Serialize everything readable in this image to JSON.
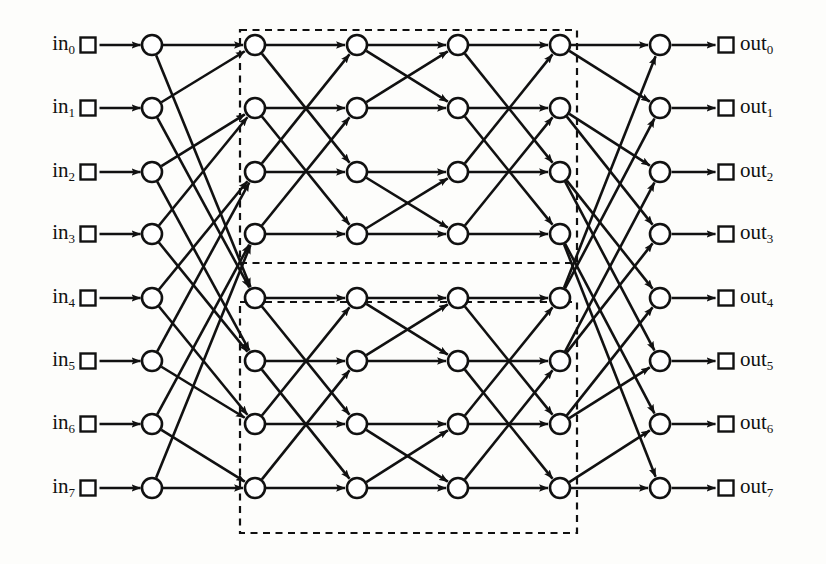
{
  "diagram": {
    "type": "multistage-interconnection-network",
    "colors": {
      "background": "#fdfdfb",
      "ink": "#111111",
      "node_fill": "#ffffff",
      "dashed_box": "#111111"
    },
    "geometry": {
      "width": 826,
      "height": 564,
      "rows_y": [
        45,
        108,
        172,
        234,
        298,
        361,
        424,
        488
      ],
      "columns_x": [
        152,
        255,
        357,
        458,
        560,
        660
      ],
      "in_box_x": 88,
      "out_box_x": 726,
      "node_radius": 10,
      "box_size": 15
    },
    "input_labels": [
      {
        "text": "in",
        "sub": "0"
      },
      {
        "text": "in",
        "sub": "1"
      },
      {
        "text": "in",
        "sub": "2"
      },
      {
        "text": "in",
        "sub": "3"
      },
      {
        "text": "in",
        "sub": "4"
      },
      {
        "text": "in",
        "sub": "5"
      },
      {
        "text": "in",
        "sub": "6"
      },
      {
        "text": "in",
        "sub": "7"
      }
    ],
    "output_labels": [
      {
        "text": "out",
        "sub": "0"
      },
      {
        "text": "out",
        "sub": "1"
      },
      {
        "text": "out",
        "sub": "2"
      },
      {
        "text": "out",
        "sub": "3"
      },
      {
        "text": "out",
        "sub": "4"
      },
      {
        "text": "out",
        "sub": "5"
      },
      {
        "text": "out",
        "sub": "6"
      },
      {
        "text": "out",
        "sub": "7"
      }
    ],
    "switch_columns": [
      {
        "index": 0,
        "rows": 8
      },
      {
        "index": 1,
        "rows": 8
      },
      {
        "index": 2,
        "rows": 8
      },
      {
        "index": 3,
        "rows": 8
      },
      {
        "index": 4,
        "rows": 8
      },
      {
        "index": 5,
        "rows": 8
      }
    ],
    "dashed_boxes": [
      {
        "name": "upper-sub-network",
        "x": 240,
        "y": 30,
        "w": 337,
        "h": 233
      },
      {
        "name": "lower-sub-network",
        "x": 240,
        "y": 302,
        "w": 337,
        "h": 231
      }
    ],
    "edge_stages": [
      {
        "from_col": 0,
        "to_col": 1,
        "name": "perfect-shuffle",
        "edges": [
          [
            0,
            0
          ],
          [
            0,
            4
          ],
          [
            1,
            0
          ],
          [
            1,
            4
          ],
          [
            2,
            1
          ],
          [
            2,
            5
          ],
          [
            3,
            1
          ],
          [
            3,
            5
          ],
          [
            4,
            2
          ],
          [
            4,
            6
          ],
          [
            5,
            2
          ],
          [
            5,
            6
          ],
          [
            6,
            3
          ],
          [
            6,
            7
          ],
          [
            7,
            3
          ],
          [
            7,
            7
          ]
        ]
      },
      {
        "from_col": 1,
        "to_col": 2,
        "name": "butterfly-stride-2",
        "edges": [
          [
            0,
            0
          ],
          [
            0,
            2
          ],
          [
            1,
            1
          ],
          [
            1,
            3
          ],
          [
            2,
            0
          ],
          [
            2,
            2
          ],
          [
            3,
            1
          ],
          [
            3,
            3
          ],
          [
            4,
            4
          ],
          [
            4,
            6
          ],
          [
            5,
            5
          ],
          [
            5,
            7
          ],
          [
            6,
            4
          ],
          [
            6,
            6
          ],
          [
            7,
            5
          ],
          [
            7,
            7
          ]
        ]
      },
      {
        "from_col": 2,
        "to_col": 3,
        "name": "butterfly-stride-1",
        "edges": [
          [
            0,
            0
          ],
          [
            0,
            1
          ],
          [
            1,
            0
          ],
          [
            1,
            1
          ],
          [
            2,
            2
          ],
          [
            2,
            3
          ],
          [
            3,
            2
          ],
          [
            3,
            3
          ],
          [
            4,
            4
          ],
          [
            4,
            5
          ],
          [
            5,
            4
          ],
          [
            5,
            5
          ],
          [
            6,
            6
          ],
          [
            6,
            7
          ],
          [
            7,
            6
          ],
          [
            7,
            7
          ]
        ]
      },
      {
        "from_col": 3,
        "to_col": 4,
        "name": "butterfly-stride-2",
        "edges": [
          [
            0,
            0
          ],
          [
            0,
            2
          ],
          [
            1,
            1
          ],
          [
            1,
            3
          ],
          [
            2,
            0
          ],
          [
            2,
            2
          ],
          [
            3,
            1
          ],
          [
            3,
            3
          ],
          [
            4,
            4
          ],
          [
            4,
            6
          ],
          [
            5,
            5
          ],
          [
            5,
            7
          ],
          [
            6,
            4
          ],
          [
            6,
            6
          ],
          [
            7,
            5
          ],
          [
            7,
            7
          ]
        ]
      },
      {
        "from_col": 4,
        "to_col": 5,
        "name": "inverse-perfect-shuffle",
        "edges": [
          [
            0,
            0
          ],
          [
            0,
            1
          ],
          [
            1,
            2
          ],
          [
            1,
            3
          ],
          [
            2,
            4
          ],
          [
            2,
            5
          ],
          [
            3,
            6
          ],
          [
            3,
            7
          ],
          [
            4,
            0
          ],
          [
            4,
            1
          ],
          [
            5,
            2
          ],
          [
            5,
            3
          ],
          [
            6,
            4
          ],
          [
            6,
            5
          ],
          [
            7,
            6
          ],
          [
            7,
            7
          ]
        ]
      }
    ],
    "input_edges": {
      "name": "input-to-col0",
      "count": 8
    },
    "output_edges": {
      "name": "col5-to-output",
      "count": 8
    }
  }
}
